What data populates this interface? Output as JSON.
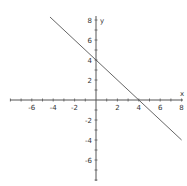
{
  "chart_data": {
    "type": "line",
    "title": "",
    "xlabel": "x",
    "ylabel": "y",
    "xlim": [
      -8,
      8
    ],
    "ylim": [
      -8,
      8
    ],
    "grid": false,
    "x_ticks": [
      -6,
      -4,
      -2,
      2,
      4,
      6,
      8
    ],
    "y_ticks": [
      8,
      6,
      4,
      2,
      -2,
      -4,
      -6
    ],
    "x_tick_labels": [
      "-6",
      "-4",
      "-2",
      "2",
      "4",
      "6",
      "8"
    ],
    "y_tick_labels": [
      "8",
      "6",
      "4",
      "2",
      "-2",
      "-4",
      "-6"
    ],
    "series": [
      {
        "name": "y = -x + 4",
        "x": [
          -4.3,
          8
        ],
        "y": [
          8.3,
          -4
        ],
        "color": "#555555"
      }
    ],
    "annotations": []
  },
  "colors": {
    "axis": "#555555",
    "line": "#555555",
    "text": "#333333"
  }
}
